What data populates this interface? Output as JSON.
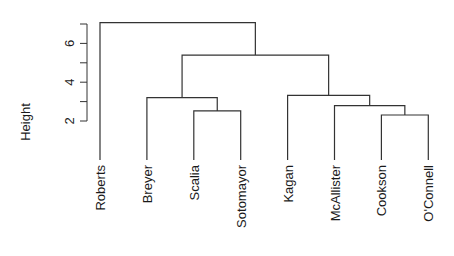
{
  "chart_data": {
    "type": "dendrogram",
    "title": "",
    "xlabel": "",
    "ylabel": "Height",
    "ylim": [
      2,
      7
    ],
    "yticks": [
      2,
      3,
      4,
      5,
      6,
      7
    ],
    "ytick_labels": [
      "2",
      "",
      "4",
      "",
      "6",
      ""
    ],
    "leaves": [
      "Roberts",
      "Breyer",
      "Scalia",
      "Sotomayor",
      "Kagan",
      "McAllister",
      "Cookson",
      "O'Connell"
    ],
    "merges": [
      {
        "members": [
          "Cookson",
          "O'Connell"
        ],
        "height": 2.31
      },
      {
        "members": [
          "Scalia",
          "Sotomayor"
        ],
        "height": 2.52
      },
      {
        "members": [
          "McAllister",
          "Cookson+O'Connell"
        ],
        "height": 2.79
      },
      {
        "members": [
          "Breyer",
          "Scalia+Sotomayor"
        ],
        "height": 3.2
      },
      {
        "members": [
          "Kagan",
          "McAllister+Cookson+O'Connell"
        ],
        "height": 3.32
      },
      {
        "members": [
          "Breyer-cluster",
          "Kagan-cluster"
        ],
        "height": 5.4
      },
      {
        "members": [
          "Roberts",
          "all-others"
        ],
        "height": 7.07
      }
    ],
    "grid": false,
    "legend": null
  },
  "colors": {
    "line": "#333333",
    "text": "#1a1a1a"
  }
}
